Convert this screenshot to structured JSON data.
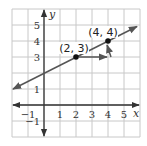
{
  "chart_data": {
    "type": "line",
    "title": "",
    "xlabel": "x",
    "ylabel": "y",
    "xlim": [
      -2,
      6
    ],
    "ylim": [
      -2,
      6
    ],
    "grid": true,
    "x_ticks": [
      "-1",
      "1",
      "2",
      "3",
      "4",
      "5"
    ],
    "y_ticks": [
      "5",
      "4",
      "3",
      "1",
      "-1"
    ],
    "series": [
      {
        "name": "line",
        "slope": 0.5,
        "intercept": 2,
        "x": [
          -2,
          6
        ],
        "y": [
          1,
          5
        ]
      }
    ],
    "points": [
      {
        "x": 2,
        "y": 3,
        "label": "(2, 3)"
      },
      {
        "x": 4,
        "y": 4,
        "label": "(4, 4)"
      }
    ],
    "annotations": [
      {
        "type": "run-arrow",
        "from": [
          2,
          3
        ],
        "to": [
          4,
          3
        ]
      },
      {
        "type": "rise-arrow",
        "from": [
          4,
          3
        ],
        "to": [
          4,
          4
        ]
      }
    ]
  },
  "colors": {
    "grid": "#c8c8c8",
    "axis": "#333333",
    "line": "#555555",
    "point": "#111111"
  }
}
